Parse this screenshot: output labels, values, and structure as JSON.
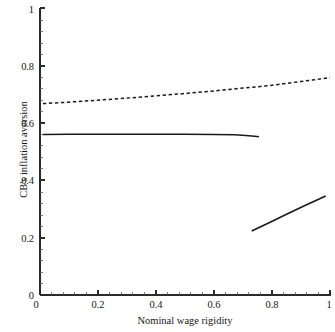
{
  "chart_data": {
    "type": "line",
    "title": "",
    "xlabel": "Nominal wage rigidity",
    "ylabel": "CB's inflation aversion",
    "xlim": [
      0,
      1
    ],
    "ylim": [
      0,
      1
    ],
    "grid": false,
    "legend": "none",
    "xticks": [
      "0",
      "0.2",
      "0.4",
      "0.6",
      "0.8",
      "1"
    ],
    "xtick_values": [
      0,
      0.2,
      0.4,
      0.6,
      0.8,
      1
    ],
    "yticks": [
      "0",
      "0.2",
      "0.4",
      "0.6",
      "0.8",
      "1"
    ],
    "ytick_values": [
      0,
      0.2,
      0.4,
      0.6,
      0.8,
      1
    ],
    "minor_ticks": true,
    "axes_style": "left-and-bottom-spines",
    "series": [
      {
        "name": "upper-dashed-curve",
        "style": "dashed",
        "color": "#1a1a1a",
        "x": [
          0.01,
          0.1,
          0.2,
          0.3,
          0.4,
          0.5,
          0.6,
          0.7,
          0.755,
          0.8,
          0.9,
          1.0
        ],
        "y": [
          0.667,
          0.672,
          0.679,
          0.686,
          0.694,
          0.702,
          0.711,
          0.721,
          0.726,
          0.731,
          0.744,
          0.757
        ]
      },
      {
        "name": "middle-solid-curve",
        "style": "solid",
        "color": "#1a1a1a",
        "x": [
          0.01,
          0.1,
          0.2,
          0.3,
          0.4,
          0.5,
          0.6,
          0.67,
          0.71,
          0.74,
          0.755
        ],
        "y": [
          0.559,
          0.56,
          0.56,
          0.56,
          0.56,
          0.56,
          0.559,
          0.558,
          0.556,
          0.553,
          0.551
        ]
      },
      {
        "name": "lower-solid-curve",
        "style": "solid",
        "color": "#1a1a1a",
        "x": [
          0.73,
          0.79,
          0.85,
          0.91,
          0.985
        ],
        "y": [
          0.223,
          0.252,
          0.281,
          0.31,
          0.345
        ]
      }
    ]
  },
  "axis": {
    "x_title": "Nominal wage rigidity",
    "y_title": "CB's inflation aversion",
    "x_tick_labels": [
      "0",
      "0.2",
      "0.4",
      "0.6",
      "0.8",
      "1"
    ],
    "y_tick_labels": [
      "0",
      "0.2",
      "0.4",
      "0.6",
      "0.8",
      "1"
    ]
  },
  "colors": {
    "line": "#1a1a1a",
    "axis": "#2b2b2b",
    "background": "#ffffff",
    "text": "#161616"
  }
}
